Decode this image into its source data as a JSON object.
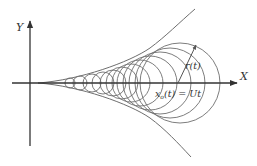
{
  "diagram": {
    "type": "expanding-circles-envelope",
    "stroke_color": "#6e6e6e",
    "axis_color": "#333333",
    "axes": {
      "x": {
        "label": "X",
        "from": [
          12,
          83
        ],
        "to": [
          237,
          83
        ]
      },
      "y": {
        "label": "Y",
        "from": [
          30,
          146
        ],
        "to": [
          30,
          21
        ]
      }
    },
    "envelope": {
      "upper": "M38,83 C80,80 130,62 150,48 C165,37 180,22 195,9",
      "lower": "M38,83 C80,86 130,104 150,118 C165,129 178,143 191,157"
    },
    "circles": [
      {
        "cx": 70,
        "r": 5
      },
      {
        "cx": 80,
        "r": 7
      },
      {
        "cx": 92,
        "r": 9
      },
      {
        "cx": 103,
        "r": 11
      },
      {
        "cx": 113,
        "r": 13
      },
      {
        "cx": 122,
        "r": 16
      },
      {
        "cx": 131,
        "r": 19
      },
      {
        "cx": 140,
        "r": 23
      },
      {
        "cx": 150,
        "r": 27
      },
      {
        "cx": 160,
        "r": 31
      },
      {
        "cx": 170,
        "r": 35
      },
      {
        "cx": 180,
        "r": 40
      }
    ],
    "radius_arrow": {
      "from": [
        178,
        83
      ],
      "to": [
        196,
        45
      ],
      "label": "r(t)"
    },
    "center_label": {
      "text_main": "x",
      "subscript": "o",
      "rest": "(t) = Ut"
    }
  }
}
